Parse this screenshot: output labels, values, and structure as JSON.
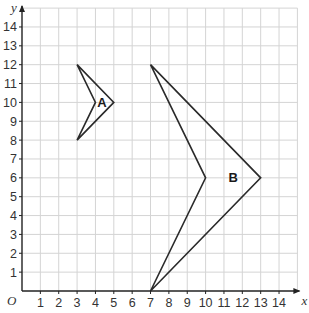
{
  "axes": {
    "x_label": "x",
    "y_label": "y",
    "origin_label": "O",
    "x_ticks": [
      "1",
      "2",
      "3",
      "4",
      "5",
      "6",
      "7",
      "8",
      "9",
      "10",
      "11",
      "12",
      "13",
      "14"
    ],
    "y_ticks": [
      "1",
      "2",
      "3",
      "4",
      "5",
      "6",
      "7",
      "8",
      "9",
      "10",
      "11",
      "12",
      "13",
      "14"
    ],
    "x_range": [
      0,
      15
    ],
    "y_range": [
      0,
      15
    ]
  },
  "shapes": [
    {
      "name": "A",
      "label": "A",
      "vertices": [
        [
          3,
          12
        ],
        [
          5,
          10
        ],
        [
          3,
          8
        ],
        [
          4,
          10
        ]
      ],
      "label_pos": [
        4.35,
        10
      ]
    },
    {
      "name": "B",
      "label": "B",
      "vertices": [
        [
          7,
          12
        ],
        [
          13,
          6
        ],
        [
          7,
          0
        ],
        [
          10,
          6
        ]
      ],
      "label_pos": [
        11.5,
        6
      ]
    }
  ],
  "colors": {
    "grid": "#d4d4d4",
    "axis": "#222222",
    "shape_stroke": "#2a2a2a",
    "text": "#333333"
  }
}
